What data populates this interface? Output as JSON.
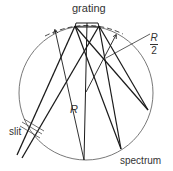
{
  "diagram": {
    "labels": {
      "grating": "grating",
      "slit": "slit",
      "spectrum": "spectrum",
      "radius": "R",
      "half_radius_num": "R",
      "half_radius_den": "2"
    },
    "colors": {
      "line": "#1a1a1a",
      "circle": "#555555",
      "text": "#333333",
      "background": "#ffffff"
    },
    "circle": {
      "cx": 86,
      "cy": 93,
      "r": 67
    }
  }
}
